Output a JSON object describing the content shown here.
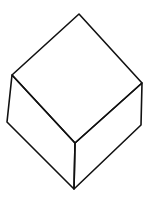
{
  "figure": {
    "type": "line-drawing",
    "stroke_color": "#111111",
    "background": "#ffffff",
    "vertices": {
      "top": [
        79,
        14
      ],
      "left_top": [
        12,
        75
      ],
      "right_top": [
        142,
        83
      ],
      "front_top": [
        75,
        143
      ],
      "left_bottom": [
        7,
        122
      ],
      "right_bottom": [
        141,
        125
      ],
      "front_bottom": [
        74,
        189
      ]
    },
    "faces": [
      "top-face",
      "left-face",
      "right-face"
    ]
  }
}
